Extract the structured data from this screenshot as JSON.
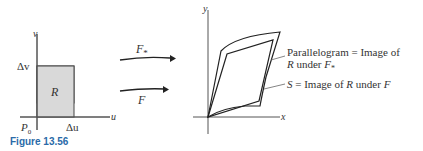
{
  "caption": "Figure 13.56",
  "left_plot": {
    "axis_v": "v",
    "axis_u": "u",
    "delta_v": "Δv",
    "delta_u": "Δu",
    "origin": "P",
    "origin_sub": "0",
    "region": "R",
    "region_fill": "#d9d9d9"
  },
  "arrows": {
    "top_label": "F",
    "top_label_sub": "*",
    "bottom_label": "F"
  },
  "right_plot": {
    "axis_y": "y",
    "axis_x": "x",
    "annotation_1_line1": "Parallelogram = Image of",
    "annotation_1_line2_a": "R",
    "annotation_1_line2_b": " under ",
    "annotation_1_line2_c": "F",
    "annotation_1_line2_sub": "*",
    "annotation_2_a": "S",
    "annotation_2_b": " = Image of ",
    "annotation_2_c": "R",
    "annotation_2_d": " under ",
    "annotation_2_e": "F"
  }
}
